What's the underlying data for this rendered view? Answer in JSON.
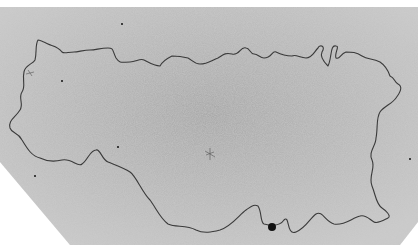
{
  "image": {
    "kind": "electron-micrograph",
    "subject": "circular DNA molecule loop",
    "width": 418,
    "height": 249,
    "colors": {
      "background": "#ffffff",
      "field": "#b4b4b4",
      "field_light": "#c8c8c8",
      "strand": "#3a3a3a",
      "particle": "#111111"
    },
    "field_polygon": "0,7 418,7 418,222 400,245 70,245 0,162",
    "loop_path": "M38,40 C35,45 37,52 35,60 C33,64 25,65 24,72 C22,80 26,86 22,92 C18,98 24,104 20,110 C15,118 8,120 10,128 C12,134 18,132 22,140 C28,150 32,156 40,158 C48,162 54,162 62,160 C72,158 78,168 82,164 C88,160 90,150 96,150 C100,148 102,160 108,162 C118,166 124,168 130,172 C136,176 142,192 150,200 C156,208 160,218 168,224 C176,228 186,224 196,230 C204,234 212,232 220,230 C232,226 240,214 246,210 C252,206 254,204 258,206 C262,212 260,222 264,224 C272,226 280,226 284,220 C290,214 286,236 296,232 C306,228 310,218 316,214 C322,210 326,222 334,224 C344,226 352,218 360,216 C366,214 370,220 374,222 C378,224 384,220 388,218 C392,216 385,210 382,208 C376,204 376,196 372,186 C368,176 376,168 372,160 C368,152 376,146 376,138 C378,128 376,118 380,112 C384,106 392,104 396,98 C402,90 402,86 398,84 C394,82 395,78 390,76 C388,70 386,66 380,62 C372,58 368,60 362,56 C356,52 352,52 346,52 C340,54 340,60 336,58 C334,54 340,46 336,46 C330,44 332,58 328,66 C324,62 320,56 322,52 C326,46 320,44 318,48 C314,52 312,58 306,58 C300,58 296,54 292,56 C286,56 280,54 276,52 C272,50 272,58 264,58 C260,58 258,54 254,54 C250,54 250,48 246,48 C240,46 240,56 232,54 C224,52 222,56 218,58 C212,60 208,64 200,64 C194,64 192,60 188,58 C180,56 176,56 172,56 C168,58 162,62 160,66 C154,66 148,62 144,60 C140,58 136,62 130,62 C122,62 120,64 116,58 C112,50 114,48 108,48 C100,48 96,50 90,50 C84,50 78,52 74,52 C68,52 64,54 62,52 C58,46 52,46 48,44 C44,42 40,40 38,40 Z",
    "particles": [
      {
        "cx": 272,
        "cy": 227,
        "r": 4
      },
      {
        "cx": 122,
        "cy": 24,
        "r": 1
      },
      {
        "cx": 62,
        "cy": 81,
        "r": 1
      },
      {
        "cx": 118,
        "cy": 147,
        "r": 1
      },
      {
        "cx": 35,
        "cy": 176,
        "r": 1
      },
      {
        "cx": 410,
        "cy": 159,
        "r": 1
      }
    ],
    "artifacts": [
      {
        "path": "M206,155 L214,152 M210,148 L210,160 M205,151 L215,157",
        "label": "x-shaped speck"
      },
      {
        "path": "M28,70 L32,76 M26,74 L34,72",
        "label": "small speck"
      }
    ]
  }
}
